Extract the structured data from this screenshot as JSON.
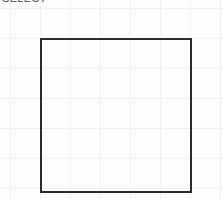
{
  "canvas": {
    "width": 223,
    "height": 199,
    "background_color": "#fdfdfd",
    "grid": {
      "enabled": true,
      "line_color": "#f1f1f1",
      "spacing_px": 30,
      "vertical_line_x": [
        10,
        40,
        70,
        100,
        130,
        160,
        190,
        220
      ],
      "horizontal_line_y": [
        8,
        38,
        68,
        98,
        128,
        158,
        188
      ]
    }
  },
  "header": {
    "label_text": "SELECT",
    "label_clipped": true
  },
  "shapes": [
    {
      "name": "rectangle",
      "type": "rect",
      "x": 40,
      "y": 38,
      "width": 152,
      "height": 155,
      "border_color": "#2b2b2b",
      "border_width_px": 2,
      "fill_color": "transparent"
    }
  ]
}
